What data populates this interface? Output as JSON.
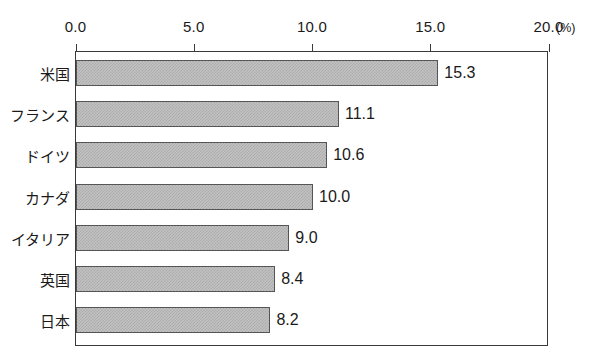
{
  "chart_data": {
    "type": "bar",
    "orientation": "horizontal",
    "title": "",
    "xlabel": "",
    "ylabel": "",
    "unit_label": "(%)",
    "xlim": [
      0.0,
      20.0
    ],
    "grid": false,
    "legend": null,
    "axis_position": "top",
    "tick_labels": [
      "0.0",
      "5.0",
      "10.0",
      "15.0",
      "20.0"
    ],
    "tick_values": [
      0.0,
      5.0,
      10.0,
      15.0,
      20.0
    ],
    "categories": [
      "米国",
      "フランス",
      "ドイツ",
      "カナダ",
      "イタリア",
      "英国",
      "日本"
    ],
    "values": [
      15.3,
      11.1,
      10.6,
      10.0,
      9.0,
      8.4,
      8.2
    ],
    "value_labels": [
      "15.3",
      "11.1",
      "10.6",
      "10.0",
      "9.0",
      "8.4",
      "8.2"
    ],
    "bars": [
      {
        "category": "米国",
        "value": 15.3,
        "label": "15.3"
      },
      {
        "category": "フランス",
        "value": 11.1,
        "label": "11.1"
      },
      {
        "category": "ドイツ",
        "value": 10.6,
        "label": "10.6"
      },
      {
        "category": "カナダ",
        "value": 10.0,
        "label": "10.0"
      },
      {
        "category": "イタリア",
        "value": 9.0,
        "label": "9.0"
      },
      {
        "category": "英国",
        "value": 8.4,
        "label": "8.4"
      },
      {
        "category": "日本",
        "value": 8.2,
        "label": "8.2"
      }
    ],
    "colors": {
      "bar_fill": "#c2c2c2",
      "bar_pattern": "#ababab",
      "bar_border": "#555555",
      "axis": "#3a3a3a",
      "text": "#1a1a1a",
      "background": "#ffffff"
    }
  }
}
